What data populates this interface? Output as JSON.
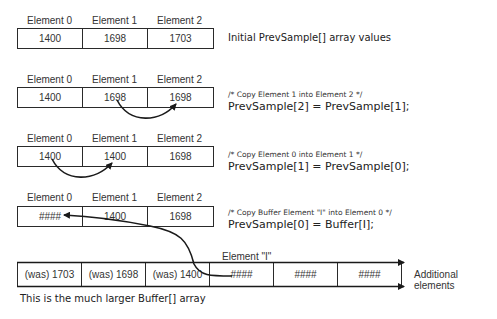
{
  "element_labels": [
    "Element 0",
    "Element 1",
    "Element 2"
  ],
  "steps": [
    {
      "values": [
        "1400",
        "1698",
        "1703"
      ],
      "description": "Initial PrevSample[] array values"
    },
    {
      "values": [
        "1400",
        "1698",
        "1698"
      ],
      "comment": "/* Copy Element 1 into Element 2 */",
      "code": "PrevSample[2] = PrevSample[1];"
    },
    {
      "values": [
        "1400",
        "1400",
        "1698"
      ],
      "comment": "/* Copy Element 0 into Element 1 */",
      "code": "PrevSample[1] = PrevSample[0];"
    },
    {
      "values": [
        "####",
        "1400",
        "1698"
      ],
      "comment": "/* Copy Buffer Element \"I\" into Element 0 */",
      "code": "PrevSample[0] = Buffer[I];"
    }
  ],
  "buffer": {
    "element_i_label": "Element \"I\"",
    "cells": [
      "(was) 1703",
      "(was) 1698",
      "(was) 1400",
      "####",
      "####",
      "####"
    ],
    "additional_label": "Additional elements",
    "caption": "This is the much larger Buffer[] array"
  }
}
